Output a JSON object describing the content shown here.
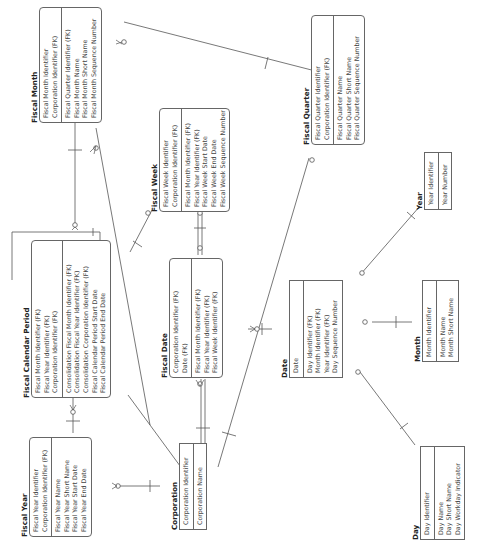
{
  "diagram": {
    "type": "entity-relationship",
    "orientation": "rotated -90deg",
    "entities": [
      {
        "name": "Fiscal Month",
        "keys": [
          "Fiscal Month Identifier",
          "Corporation Identifier (FK)"
        ],
        "attributes": [
          "Fiscal Quarter Identifier (FK)",
          "Fiscal Month Name",
          "Fiscal Month Short Name",
          "Fiscal Month Sequence Number"
        ]
      },
      {
        "name": "Fiscal Quarter",
        "keys": [
          "Fiscal Quarter Identifier",
          "Corporation Identifier (FK)"
        ],
        "attributes": [
          "Fiscal Quarter Name",
          "Fiscal Quarter Short Name",
          "Fiscal Quarter Sequence Number"
        ]
      },
      {
        "name": "Fiscal Week",
        "keys": [
          "Fiscal Week Identifier",
          "Corporation Identifier (FK)"
        ],
        "attributes": [
          "Fiscal Month Identifier (FK)",
          "Fiscal Year Identifier (FK)",
          "Fiscal Week Start Date",
          "Fiscal Week End Date",
          "Fiscal Week Sequence Number"
        ]
      },
      {
        "name": "Fiscal Calendar Period",
        "keys": [
          "Fiscal Month Identifier (FK)",
          "Fiscal Year Identifier (FK)",
          "Corporation Identifier (FK)"
        ],
        "attributes": [
          "Consolidation Fiscal Month Identifier (FK)",
          "Consolidation Fiscal Year Identifier (FK)",
          "Consolidation Corporation Identifier (FK)",
          "Fiscal Calendar Period Start Date",
          "Fiscal Calendar Period End Date"
        ]
      },
      {
        "name": "Fiscal Date",
        "keys": [
          "Corporation Identifier (FK)",
          "Date (FK)"
        ],
        "attributes": [
          "Fiscal Month Identifier (FK)",
          "Fiscal Year Identifier (FK)",
          "Fiscal Week Identifier (FK)"
        ]
      },
      {
        "name": "Fiscal Year",
        "keys": [
          "Fiscal Year Identifier",
          "Corporation Identifier (FK)"
        ],
        "attributes": [
          "Fiscal Year Name",
          "Fiscal Year Short Name",
          "Fiscal Year Start Date",
          "Fiscal Year End Date"
        ]
      },
      {
        "name": "Corporation",
        "keys": [
          "Corporation Identifier"
        ],
        "attributes": [
          "Corporation Name"
        ]
      },
      {
        "name": "Date",
        "keys": [
          "Date"
        ],
        "attributes": [
          "Day Identifier (FK)",
          "Month Identifier (FK)",
          "Year Identifier (FK)",
          "Day Sequence Number"
        ]
      },
      {
        "name": "Year",
        "keys": [
          "Year Identifier"
        ],
        "attributes": [
          "Year Number"
        ]
      },
      {
        "name": "Month",
        "keys": [
          "Month Identifier"
        ],
        "attributes": [
          "Month Name",
          "Month Short Name"
        ]
      },
      {
        "name": "Day",
        "keys": [
          "Day Identifier"
        ],
        "attributes": [
          "Day Name",
          "Day Short Name",
          "Day Workday Indicator"
        ]
      }
    ],
    "relationships": [
      {
        "from": "Fiscal Quarter",
        "to": "Fiscal Month",
        "cardinality": "one-to-zero-or-many"
      },
      {
        "from": "Fiscal Month",
        "to": "Fiscal Calendar Period",
        "cardinality": "one-to-zero-or-many"
      },
      {
        "from": "Fiscal Month",
        "to": "Fiscal Week",
        "cardinality": "one-to-zero-or-many"
      },
      {
        "from": "Fiscal Year",
        "to": "Fiscal Calendar Period",
        "cardinality": "one-to-zero-or-many"
      },
      {
        "from": "Fiscal Calendar Period",
        "to": "Fiscal Calendar Period",
        "cardinality": "consolidation-self-reference"
      },
      {
        "from": "Fiscal Week",
        "to": "Fiscal Date",
        "cardinality": "one-to-zero-or-many"
      },
      {
        "from": "Fiscal Calendar Period",
        "to": "Fiscal Date",
        "cardinality": "one-to-zero-or-many"
      },
      {
        "from": "Corporation",
        "to": "Fiscal Year",
        "cardinality": "one-to-zero-or-many"
      },
      {
        "from": "Corporation",
        "to": "Fiscal Date",
        "cardinality": "one-to-zero-or-many"
      },
      {
        "from": "Corporation",
        "to": "Fiscal Quarter",
        "cardinality": "one-to-zero-or-many"
      },
      {
        "from": "Date",
        "to": "Fiscal Date",
        "cardinality": "one-to-zero-or-many"
      },
      {
        "from": "Year",
        "to": "Date",
        "cardinality": "one-to-zero-or-many"
      },
      {
        "from": "Month",
        "to": "Date",
        "cardinality": "one-to-zero-or-many"
      },
      {
        "from": "Day",
        "to": "Date",
        "cardinality": "one-to-zero-or-many"
      }
    ]
  }
}
